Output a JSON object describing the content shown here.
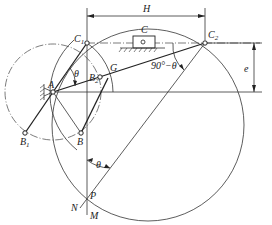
{
  "diagram": {
    "labels": {
      "H": "H",
      "C": "C",
      "C1": "C",
      "C1_sub": "1",
      "C2": "C",
      "C2_sub": "2",
      "A": "A",
      "B": "B",
      "B1": "B",
      "B1_sub": "1",
      "B2": "B",
      "B2_sub": "2",
      "G": "G",
      "theta_top": "θ",
      "angle_90": "90°−θ",
      "e": "e",
      "theta_bottom": "θ",
      "P": "P",
      "N": "N",
      "M": "M"
    },
    "points": {
      "C1": [
        87,
        43
      ],
      "C2": [
        205,
        43
      ],
      "A": [
        53,
        92
      ],
      "B2": [
        100,
        77
      ],
      "G": [
        118,
        70
      ],
      "B1": [
        25,
        133
      ],
      "B": [
        81,
        133
      ],
      "P": [
        87,
        198
      ]
    },
    "colors": {
      "line": "#333333",
      "background": "#ffffff"
    }
  }
}
